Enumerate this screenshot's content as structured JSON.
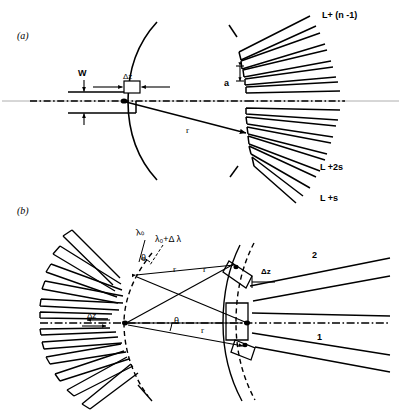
{
  "figure": {
    "caption_panels": [
      {
        "id": "a",
        "label": "(a)"
      },
      {
        "id": "b",
        "label": "(b)"
      }
    ],
    "background_color": "#ffffff",
    "line_color": "#000000",
    "axis_color": "#000000"
  },
  "panel_a": {
    "label": "(a)",
    "labels": {
      "width": "W",
      "delta_z": "Δz",
      "slat_spacing": "a",
      "radius": "r",
      "top_arm": "L+ (n -1)",
      "bottom_arm_2s": "L +2s",
      "bottom_arm_s": "L +s"
    },
    "geometry": {
      "source_point_x": 122,
      "source_point_y": 101,
      "focus_point_x": 247,
      "focus_point_y": 131,
      "fan_apex_x": 247,
      "fan_apex_y": 101,
      "arc_left_center_x": 330,
      "arc_left_radius": 212,
      "slat_count": 11,
      "axis_y": 101
    }
  },
  "panel_b": {
    "label": "(b)",
    "labels": {
      "lambda_0": "λ₀",
      "lambda_0_plus": "λ₀+Δ λ",
      "theta_upper": "θ",
      "theta_axis": "θ",
      "r_upper_left": "r",
      "r_upper_right": "r",
      "r_lower": "r",
      "delta_z_left": "Δz",
      "delta_z_right": "Δz",
      "beam_1": "1",
      "beam_2": "2"
    },
    "geometry": {
      "left_apex_x": 110,
      "left_apex_y": 323,
      "right_focus_x": 247,
      "right_focus_y": 323,
      "upper_detect_x": 233,
      "upper_detect_y": 262,
      "lower_detect_x": 246,
      "lower_detect_y": 345,
      "slat_count_left": 11,
      "axis_y": 323
    }
  },
  "colors": {
    "stroke": "#1a1a1a",
    "axis": "#000000",
    "faint_axis": "#8c8c8c"
  }
}
